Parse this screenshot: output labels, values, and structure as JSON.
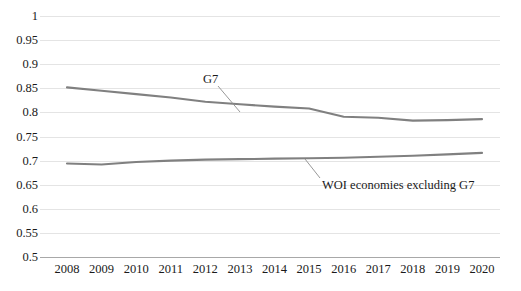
{
  "chart_data": {
    "type": "line",
    "title": "",
    "subtitle": "",
    "xlabel": "",
    "ylabel": "",
    "x": [
      2008,
      2009,
      2010,
      2011,
      2012,
      2013,
      2014,
      2015,
      2016,
      2017,
      2018,
      2019,
      2020
    ],
    "categories": [
      "2008",
      "2009",
      "2010",
      "2011",
      "2012",
      "2013",
      "2014",
      "2015",
      "2016",
      "2017",
      "2018",
      "2019",
      "2020"
    ],
    "xlim": [
      2008,
      2020
    ],
    "ylim": [
      0.5,
      1
    ],
    "ytick_labels": [
      "1",
      "0.95",
      "0.9",
      "0.85",
      "0.8",
      "0.75",
      "0.7",
      "0.65",
      "0.6",
      "0.55",
      "0.5"
    ],
    "ytick_values": [
      1,
      0.95,
      0.9,
      0.85,
      0.8,
      0.75,
      0.7,
      0.65,
      0.6,
      0.55,
      0.5
    ],
    "grid": true,
    "grid_color": "#e4e4e4",
    "axis_color": "#a8a8a8",
    "legend": "annotations",
    "legend_position": "inline-annotations",
    "series": [
      {
        "name": "G7",
        "color": "#808080",
        "values": [
          0.852,
          0.845,
          0.838,
          0.831,
          0.822,
          0.817,
          0.812,
          0.808,
          0.791,
          0.789,
          0.783,
          0.784,
          0.786
        ],
        "annotation": {
          "text": "G7",
          "label_x": 203,
          "label_y": 72,
          "leader_from_x": 218,
          "leader_from_y": 86,
          "leader_to_x": 240,
          "leader_to_y": 112
        }
      },
      {
        "name": "WOI economies excluding G7",
        "color": "#808080",
        "values": [
          0.694,
          0.692,
          0.697,
          0.7,
          0.702,
          0.703,
          0.704,
          0.705,
          0.706,
          0.708,
          0.71,
          0.713,
          0.716
        ],
        "annotation": {
          "text": "WOI economies excluding G7",
          "label_x": 322,
          "label_y": 178,
          "leader_from_x": 320,
          "leader_from_y": 178,
          "leader_to_x": 305,
          "leader_to_y": 159
        }
      }
    ]
  }
}
